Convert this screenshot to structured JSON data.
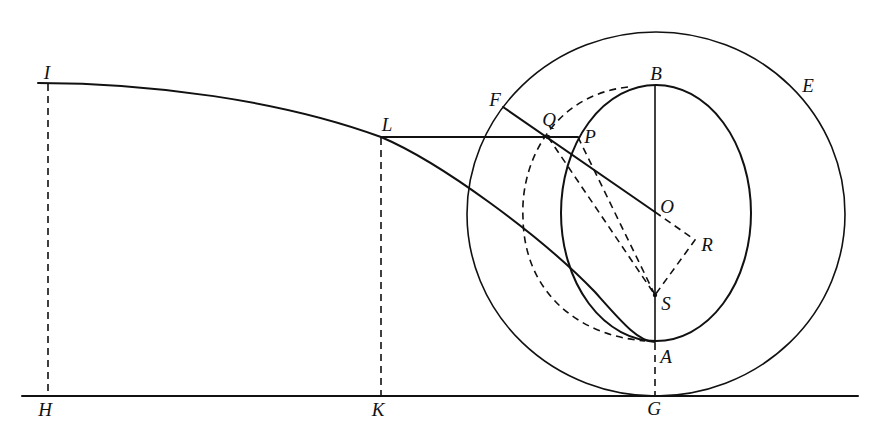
{
  "diagram": {
    "type": "geometric construction",
    "points": {
      "I": "I",
      "L": "L",
      "F": "F",
      "Q": "Q",
      "P": "P",
      "B": "B",
      "E": "E",
      "O": "O",
      "R": "R",
      "S": "S",
      "A": "A",
      "H": "H",
      "K": "K",
      "G": "G"
    },
    "elements": [
      "baseline H-K-G",
      "curve I-L-A",
      "dashed I-H",
      "dashed L-K",
      "dashed A-G",
      "segment L-P",
      "outer circle E (center O, tangent at G)",
      "inner oval through B and A",
      "dashed arc through Q",
      "segment F-Q-O",
      "axis B-O-S-A",
      "dashed O-R-S",
      "dashed Q-S",
      "dashed P-S"
    ]
  }
}
